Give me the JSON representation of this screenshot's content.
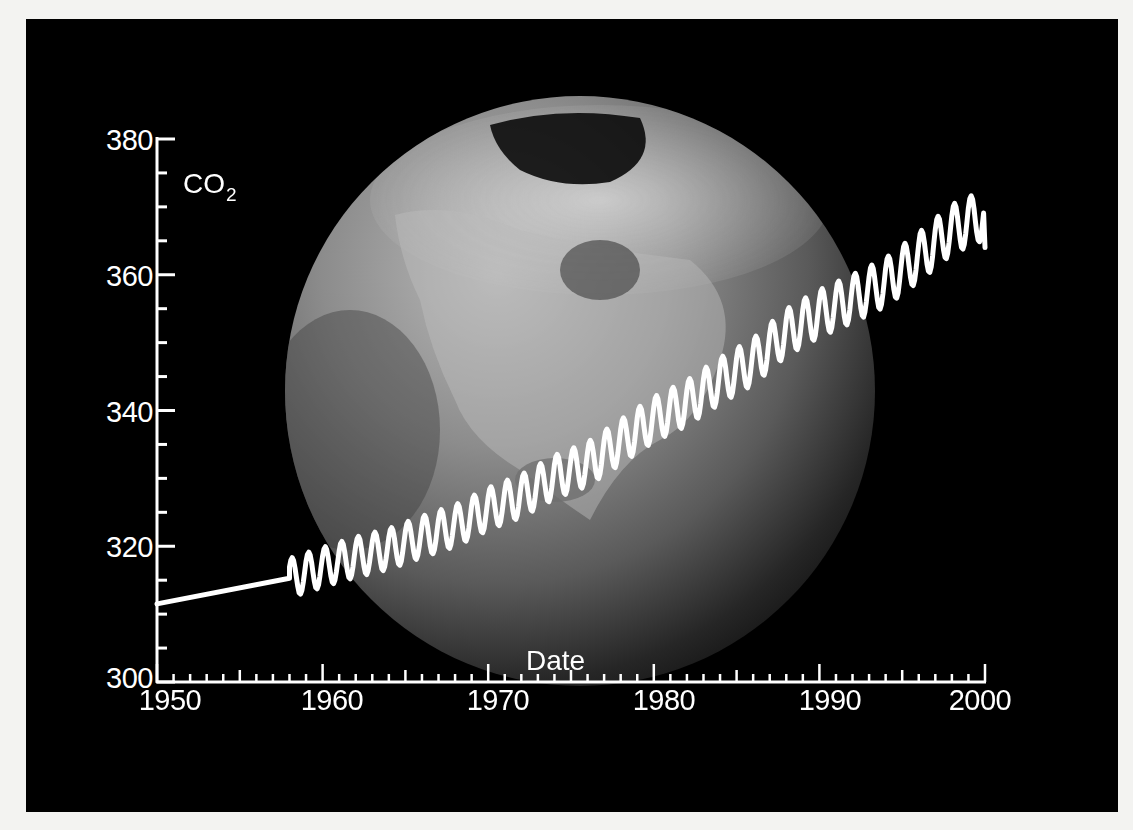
{
  "chart_data": {
    "type": "line",
    "title": "",
    "ylabel": "CO2",
    "ylabel_main": "CO",
    "ylabel_sub": "2",
    "xlabel": "Date",
    "xlim": [
      1950,
      2000
    ],
    "ylim": [
      300,
      380
    ],
    "x_ticks": [
      "1950",
      "1960",
      "1970",
      "1980",
      "1990",
      "2000"
    ],
    "y_ticks": [
      "300",
      "320",
      "340",
      "360",
      "380"
    ],
    "x_minor_step": 1,
    "y_minor_step": 5,
    "grid": false,
    "legend": null,
    "background": "photo of Earth globe (North America) in grayscale",
    "series": [
      {
        "name": "Atmospheric CO2 (ppm)",
        "color": "#ffffff",
        "pre_1958_linear": {
          "x": [
            1950,
            1958
          ],
          "y": [
            311.5,
            315.3
          ]
        },
        "annual_mean": {
          "x": [
            1958,
            1960,
            1962,
            1964,
            1966,
            1968,
            1970,
            1972,
            1974,
            1976,
            1978,
            1980,
            1982,
            1984,
            1986,
            1988,
            1990,
            1992,
            1994,
            1996,
            1998,
            2000
          ],
          "y": [
            315.3,
            316.9,
            318.4,
            319.6,
            321.4,
            323.0,
            325.5,
            327.4,
            330.2,
            332.1,
            335.4,
            338.7,
            341.1,
            344.4,
            347.2,
            351.5,
            354.3,
            356.5,
            358.9,
            362.6,
            366.7,
            368.9
          ]
        },
        "seasonal_amplitude": 3.2,
        "peak_1999": 371,
        "end_value_2000": 364
      }
    ]
  }
}
